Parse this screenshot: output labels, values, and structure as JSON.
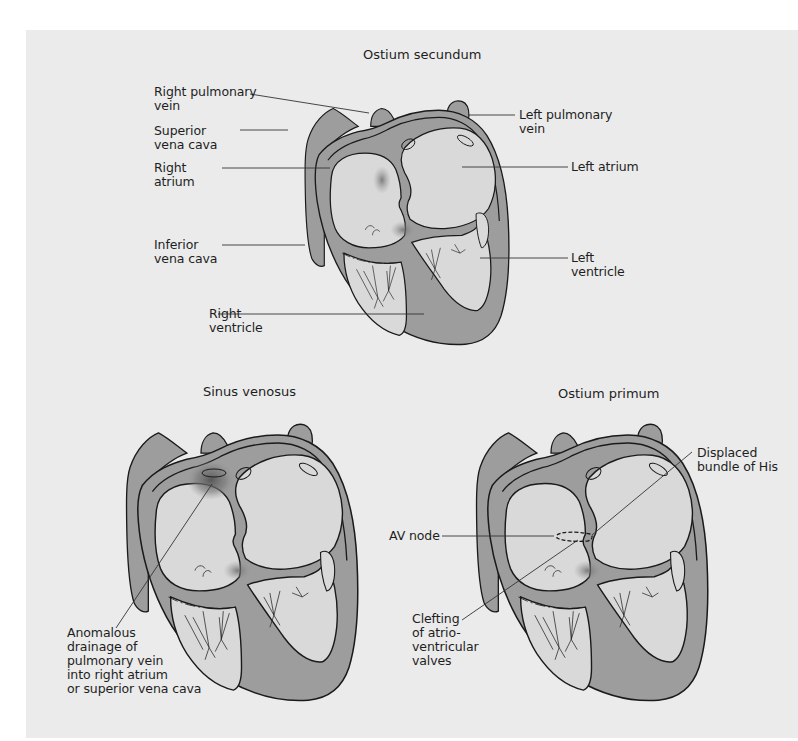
{
  "figure": {
    "background_color": "#ebebeb",
    "wall_color": "#9d9d9d",
    "chamber_color": "#d9d9d9",
    "outline_color": "#1a1a1a"
  },
  "panels": [
    {
      "id": "ostium-secundum",
      "title": "Ostium secundum",
      "labels": {
        "right_pulmonary_vein": "Right pulmonary\nvein",
        "superior_vena_cava": "Superior\nvena cava",
        "right_atrium": "Right\natrium",
        "inferior_vena_cava": "Inferior\nvena cava",
        "right_ventricle": "Right\nventricle",
        "left_pulmonary_vein": "Left pulmonary\nvein",
        "left_atrium": "Left atrium",
        "left_ventricle": "Left\nventricle"
      }
    },
    {
      "id": "sinus-venosus",
      "title": "Sinus venosus",
      "labels": {
        "anomalous_drainage": "Anomalous\ndrainage of\npulmonary vein\ninto right atrium\nor superior vena cava"
      }
    },
    {
      "id": "ostium-primum",
      "title": "Ostium primum",
      "labels": {
        "displaced_bundle": "Displaced\nbundle of His",
        "av_node": "AV node",
        "clefting": "Clefting\nof atrio-\nventricular\nvalves"
      }
    }
  ]
}
